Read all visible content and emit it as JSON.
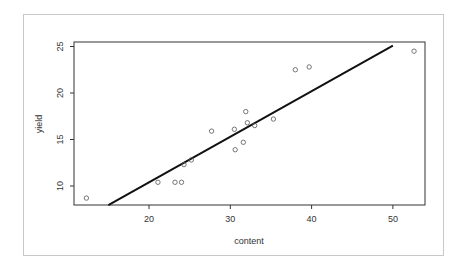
{
  "chart_data": {
    "type": "scatter",
    "title": "",
    "xlabel": "content",
    "ylabel": "yield",
    "xlim": [
      11,
      54
    ],
    "ylim": [
      8,
      25.4
    ],
    "xticks": [
      20,
      30,
      40,
      50
    ],
    "yticks": [
      10,
      15,
      20,
      25
    ],
    "grid": false,
    "legend": null,
    "points": [
      {
        "x": 12.3,
        "y": 8.7
      },
      {
        "x": 21.1,
        "y": 10.4
      },
      {
        "x": 23.2,
        "y": 10.4
      },
      {
        "x": 24.0,
        "y": 10.4
      },
      {
        "x": 24.3,
        "y": 12.3
      },
      {
        "x": 25.2,
        "y": 12.8
      },
      {
        "x": 27.7,
        "y": 15.9
      },
      {
        "x": 30.5,
        "y": 16.1
      },
      {
        "x": 30.6,
        "y": 13.9
      },
      {
        "x": 31.6,
        "y": 14.7
      },
      {
        "x": 31.9,
        "y": 18.0
      },
      {
        "x": 32.1,
        "y": 16.8
      },
      {
        "x": 33.0,
        "y": 16.5
      },
      {
        "x": 35.3,
        "y": 17.2
      },
      {
        "x": 38.0,
        "y": 22.5
      },
      {
        "x": 39.7,
        "y": 22.8
      },
      {
        "x": 52.6,
        "y": 24.5
      }
    ],
    "regression_line": {
      "intercept": 0.6,
      "slope": 0.49,
      "x_start": 15.0,
      "x_end": 50.0
    },
    "colors": {
      "points": "#555555",
      "line": "#111111",
      "axes": "#333333"
    }
  }
}
